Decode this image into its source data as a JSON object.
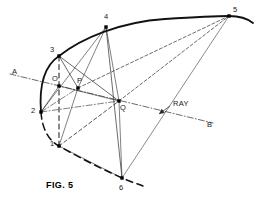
{
  "figure": {
    "caption": "FIG. 5",
    "caption_pos": [
      46,
      181
    ],
    "stroke_color": "#2b2b2b",
    "arc_color": "#111111",
    "label_color": "#1a1a1a",
    "width": 257,
    "height": 203
  },
  "nodes": [
    {
      "id": "1",
      "label": "1",
      "x": 59,
      "y": 146,
      "label_x": 50,
      "label_y": 140,
      "marker": "square"
    },
    {
      "id": "2",
      "label": "2",
      "x": 41,
      "y": 112,
      "label_x": 31,
      "label_y": 107,
      "marker": "square"
    },
    {
      "id": "3",
      "label": "3",
      "x": 59,
      "y": 56,
      "label_x": 50,
      "label_y": 46,
      "marker": "square"
    },
    {
      "id": "4",
      "label": "4",
      "x": 106,
      "y": 27,
      "label_x": 104,
      "label_y": 13,
      "marker": "square"
    },
    {
      "id": "5",
      "label": "5",
      "x": 229,
      "y": 16,
      "label_x": 233,
      "label_y": 6,
      "marker": "square"
    },
    {
      "id": "6",
      "label": "6",
      "x": 122,
      "y": 178,
      "label_x": 119,
      "label_y": 184,
      "marker": "square"
    },
    {
      "id": "O",
      "label": "O",
      "x": 59,
      "y": 86,
      "label_x": 52,
      "label_y": 75,
      "marker": "square"
    },
    {
      "id": "P",
      "label": "P",
      "x": 78,
      "y": 88,
      "label_x": 77,
      "label_y": 77,
      "marker": "square"
    },
    {
      "id": "Q",
      "label": "Q",
      "x": 119,
      "y": 101,
      "label_x": 120,
      "label_y": 104,
      "marker": "square"
    }
  ],
  "endpoint_labels": [
    {
      "id": "A",
      "label": "A",
      "x": 12,
      "y": 68
    },
    {
      "id": "B",
      "label": "B",
      "x": 207,
      "y": 121
    }
  ],
  "annotations": [
    {
      "id": "ray",
      "label": "RAY",
      "x": 173,
      "y": 100
    }
  ],
  "curves": {
    "arc_solid": "M 41 112 C 39 86 44 66 59 56 C 82 38 120 22 165 19 C 196 17 215 16 229 16 C 240 16 248 19 253 23",
    "arc_dashed": "M 41 112 C 42 128 48 140 59 146 C 78 157 100 168 122 178 C 131 182 138 184 143 186"
  },
  "segments": [
    {
      "id": "line-A-B",
      "from": [
        10,
        74
      ],
      "to": [
        213,
        123
      ],
      "style": "dashdot",
      "width": 0.7
    },
    {
      "id": "line-3-O-1",
      "from": [
        59,
        56
      ],
      "to": [
        59,
        146
      ],
      "style": "dashed",
      "width": 1.1
    },
    {
      "id": "line-4-Q-6",
      "from": [
        106,
        27
      ],
      "to": [
        122,
        178
      ],
      "style": "solid",
      "width": 0.7
    },
    {
      "id": "line-3-P",
      "from": [
        59,
        56
      ],
      "to": [
        78,
        88
      ],
      "style": "solid",
      "width": 0.7
    },
    {
      "id": "line-3-Q",
      "from": [
        59,
        56
      ],
      "to": [
        119,
        101
      ],
      "style": "solid",
      "width": 0.7
    },
    {
      "id": "line-2-P",
      "from": [
        41,
        112
      ],
      "to": [
        78,
        88
      ],
      "style": "dashdot",
      "width": 0.6
    },
    {
      "id": "line-2-4",
      "from": [
        41,
        112
      ],
      "to": [
        106,
        27
      ],
      "style": "solid",
      "width": 0.6
    },
    {
      "id": "line-1-P",
      "from": [
        59,
        146
      ],
      "to": [
        78,
        88
      ],
      "style": "solid",
      "width": 0.6
    },
    {
      "id": "line-1-Q",
      "from": [
        59,
        146
      ],
      "to": [
        119,
        101
      ],
      "style": "dashed",
      "width": 0.8
    },
    {
      "id": "line-1-6",
      "from": [
        59,
        146
      ],
      "to": [
        122,
        178
      ],
      "style": "solid",
      "width": 0.6
    },
    {
      "id": "line-O-2",
      "from": [
        59,
        86
      ],
      "to": [
        41,
        112
      ],
      "style": "solid",
      "width": 0.6
    },
    {
      "id": "line-O-Q",
      "from": [
        59,
        86
      ],
      "to": [
        119,
        101
      ],
      "style": "solid",
      "width": 0.6
    },
    {
      "id": "line-P-4",
      "from": [
        78,
        88
      ],
      "to": [
        106,
        27
      ],
      "style": "solid",
      "width": 0.6
    },
    {
      "id": "line-P-5",
      "from": [
        78,
        88
      ],
      "to": [
        229,
        16
      ],
      "style": "dashed",
      "width": 0.7
    },
    {
      "id": "line-Q-5",
      "from": [
        119,
        101
      ],
      "to": [
        229,
        16
      ],
      "style": "dashed",
      "width": 0.7
    },
    {
      "id": "line-Q-4",
      "from": [
        119,
        101
      ],
      "to": [
        106,
        27
      ],
      "style": "solid",
      "width": 0.6
    },
    {
      "id": "line-Q-6",
      "from": [
        119,
        101
      ],
      "to": [
        122,
        178
      ],
      "style": "solid",
      "width": 0.6
    },
    {
      "id": "line-6-5",
      "from": [
        122,
        178
      ],
      "to": [
        229,
        16
      ],
      "style": "solid",
      "width": 0.55
    },
    {
      "id": "line-2-Q-ray",
      "from": [
        41,
        112
      ],
      "to": [
        119,
        101
      ],
      "style": "dashdot",
      "width": 0.6
    }
  ],
  "ray_pointer": {
    "from": [
      170,
      106
    ],
    "to": [
      159,
      114
    ]
  }
}
